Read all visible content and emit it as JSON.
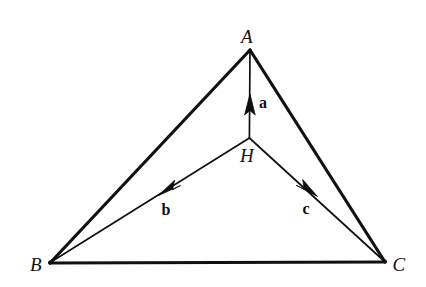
{
  "figure": {
    "kind": "geometry-diagram",
    "background_color": "#ffffff",
    "stroke_color": "#111111",
    "outline_stroke_width": 3.2,
    "inner_stroke_width": 1.7,
    "width": 426,
    "height": 287
  },
  "points": {
    "A": {
      "label": "A",
      "x": 250,
      "y": 50,
      "label_x": 247,
      "label_y": 36
    },
    "B": {
      "label": "B",
      "x": 50,
      "y": 263,
      "label_x": 36,
      "label_y": 264
    },
    "C": {
      "label": "C",
      "x": 385,
      "y": 262,
      "label_x": 399,
      "label_y": 264
    },
    "H": {
      "label": "H",
      "x": 249,
      "y": 138,
      "label_x": 247,
      "label_y": 155
    }
  },
  "edges": [
    {
      "name": "side-AB",
      "from": "A",
      "to": "B",
      "x1": 250,
      "y1": 50,
      "x2": 50,
      "y2": 263
    },
    {
      "name": "side-AC",
      "from": "A",
      "to": "C",
      "x1": 250,
      "y1": 50,
      "x2": 385,
      "y2": 262
    },
    {
      "name": "side-BC",
      "from": "B",
      "to": "C",
      "x1": 50,
      "y1": 263,
      "x2": 385,
      "y2": 262
    }
  ],
  "segments": [
    {
      "name": "segment-HA",
      "from": "H",
      "to": "A",
      "x1": 249,
      "y1": 138,
      "x2": 250,
      "y2": 52
    },
    {
      "name": "segment-HB",
      "from": "H",
      "to": "B",
      "x1": 249,
      "y1": 138,
      "x2": 50,
      "y2": 263
    },
    {
      "name": "segment-HC",
      "from": "H",
      "to": "C",
      "x1": 249,
      "y1": 138,
      "x2": 385,
      "y2": 262
    }
  ],
  "vectors": [
    {
      "name": "vector-a",
      "label": "a",
      "origin": "H",
      "direction_toward": "A",
      "tail_x": 249,
      "tail_y": 138,
      "tip_x": 250,
      "tip_y": 96,
      "label_x": 263,
      "label_y": 103
    },
    {
      "name": "vector-b",
      "label": "b",
      "origin": "H",
      "direction_toward": "B",
      "tail_x": 249,
      "tail_y": 138,
      "tip_x": 160,
      "tip_y": 194,
      "label_x": 166,
      "label_y": 210
    },
    {
      "name": "vector-c",
      "label": "c",
      "origin": "H",
      "direction_toward": "C",
      "tail_x": 249,
      "tail_y": 138,
      "tip_x": 316,
      "tip_y": 195,
      "label_x": 306,
      "label_y": 209
    }
  ]
}
